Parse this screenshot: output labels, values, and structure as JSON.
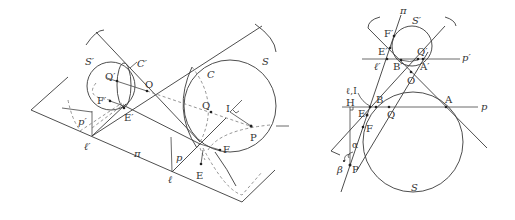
{
  "left_figure": {
    "labels": {
      "S_prime": "S′",
      "C_prime": "C′",
      "Q_prime": "Q′",
      "O": "O",
      "F_prime": "F′",
      "E_prime": "E′",
      "p_prime": "p′",
      "l_prime": "ℓ′",
      "pi": "π",
      "p": "p",
      "l": "ℓ",
      "C": "C",
      "S": "S",
      "Q": "Q",
      "I": "I",
      "P": "P",
      "F": "F",
      "E": "E"
    }
  },
  "right_figure": {
    "labels": {
      "pi": "π",
      "S_prime": "S′",
      "F_prime": "F′",
      "E_prime": "E′",
      "Q_prime": "Q′",
      "p_prime": "p′",
      "l_prime": "ℓ′",
      "B_prime": "B′",
      "A_prime": "A′",
      "O": "O",
      "l_I": "ℓ,I",
      "H": "H",
      "B": "B",
      "A": "A",
      "p": "p",
      "E": "E",
      "Q": "Q",
      "F": "F",
      "alpha": "α",
      "beta": "β",
      "P": "P",
      "S": "S"
    }
  }
}
